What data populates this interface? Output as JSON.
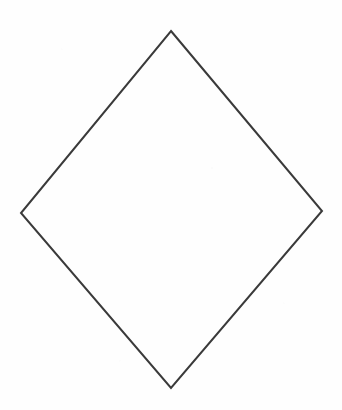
{
  "canvas": {
    "width": 342,
    "height": 410,
    "background_color": "#fefefe"
  },
  "figure": {
    "name": "diamond",
    "shape_type": "quadrilateral",
    "stroke_color": "#3a3a3a",
    "stroke_width": 2,
    "fill_color": "none",
    "vertices": [
      {
        "label": "top",
        "x": 171,
        "y": 31
      },
      {
        "label": "right",
        "x": 322,
        "y": 211
      },
      {
        "label": "bottom",
        "x": 171,
        "y": 388
      },
      {
        "label": "left",
        "x": 21,
        "y": 213
      }
    ],
    "points_attr": "171,31 322,211 171,388 21,213"
  },
  "chart_data": {
    "type": "scatter",
    "title": "",
    "xlabel": "",
    "ylabel": "",
    "grid": false,
    "legend": "none",
    "xlim": [
      0,
      342
    ],
    "ylim": [
      0,
      410
    ],
    "series": [
      {
        "name": "diamond-outline",
        "closed": true,
        "x": [
          171,
          322,
          171,
          21
        ],
        "y": [
          31,
          211,
          388,
          213
        ]
      }
    ]
  }
}
